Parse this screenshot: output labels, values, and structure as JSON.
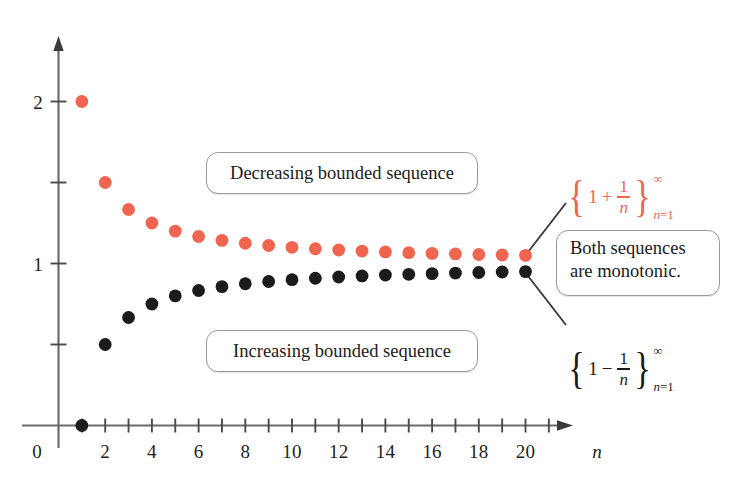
{
  "chart_data": {
    "type": "scatter",
    "title": "",
    "xlabel": "n",
    "ylabel": "",
    "xlim": [
      0,
      22
    ],
    "ylim": [
      0,
      2.3
    ],
    "grid": false,
    "legend_position": "right-annotations",
    "x_ticks_major": [
      2,
      4,
      6,
      8,
      10,
      12,
      14,
      16,
      18,
      20
    ],
    "x_tick_labels": [
      "2",
      "4",
      "6",
      "8",
      "10",
      "12",
      "14",
      "16",
      "18",
      "20"
    ],
    "x_ticks_all": [
      1,
      2,
      3,
      4,
      5,
      6,
      7,
      8,
      9,
      10,
      11,
      12,
      13,
      14,
      15,
      16,
      17,
      18,
      19,
      20,
      21
    ],
    "y_ticks": [
      0.5,
      1,
      1.5,
      2
    ],
    "y_tick_labels": [
      "",
      "1",
      "",
      "2"
    ],
    "origin_label": "0",
    "series": [
      {
        "name": "{1 + 1/n}",
        "color": "#ef6550",
        "x": [
          1,
          2,
          3,
          4,
          5,
          6,
          7,
          8,
          9,
          10,
          11,
          12,
          13,
          14,
          15,
          16,
          17,
          18,
          19,
          20
        ],
        "values": [
          2,
          1.5,
          1.3333,
          1.25,
          1.2,
          1.1667,
          1.1429,
          1.125,
          1.1111,
          1.1,
          1.0909,
          1.0833,
          1.0769,
          1.0714,
          1.0667,
          1.0625,
          1.0588,
          1.0556,
          1.0526,
          1.05
        ]
      },
      {
        "name": "{1 - 1/n}",
        "color": "#1b1b1b",
        "x": [
          1,
          2,
          3,
          4,
          5,
          6,
          7,
          8,
          9,
          10,
          11,
          12,
          13,
          14,
          15,
          16,
          17,
          18,
          19,
          20
        ],
        "values": [
          0,
          0.5,
          0.6667,
          0.75,
          0.8,
          0.8333,
          0.8571,
          0.875,
          0.8889,
          0.9,
          0.9091,
          0.9167,
          0.9231,
          0.9286,
          0.9333,
          0.9375,
          0.9412,
          0.9444,
          0.9474,
          0.95
        ]
      }
    ],
    "annotations": [
      {
        "text": "Decreasing bounded sequence"
      },
      {
        "text": "Increasing bounded sequence"
      },
      {
        "text": "Both sequences are monotonic."
      }
    ]
  },
  "axes": {
    "x_axis_label": "n",
    "origin_label": "0",
    "y_label_one": "1",
    "y_label_two": "2",
    "x_tick_labels": [
      "2",
      "4",
      "6",
      "8",
      "10",
      "12",
      "14",
      "16",
      "18",
      "20"
    ]
  },
  "callouts": {
    "decreasing": "Decreasing bounded sequence",
    "increasing": "Increasing bounded sequence",
    "monotonic_line1": "Both sequences",
    "monotonic_line2": "are monotonic."
  },
  "sequence_labels": {
    "upper": {
      "brace_open": "{",
      "brace_close": "}",
      "one": "1",
      "operator": "+",
      "numerator": "1",
      "denominator": "n",
      "superscript": "∞",
      "subscript_var": "n",
      "subscript_eq": "=1",
      "color": "#ef6550"
    },
    "lower": {
      "brace_open": "{",
      "brace_close": "}",
      "one": "1",
      "operator": "−",
      "numerator": "1",
      "denominator": "n",
      "superscript": "∞",
      "subscript_var": "n",
      "subscript_eq": "=1",
      "color": "#1b1b1b"
    }
  },
  "colors": {
    "red_series": "#ef6550",
    "black_series": "#1b1b1b",
    "axis": "#6b6b6b",
    "callout_border": "#9a9a9a",
    "background": "#ffffff"
  }
}
